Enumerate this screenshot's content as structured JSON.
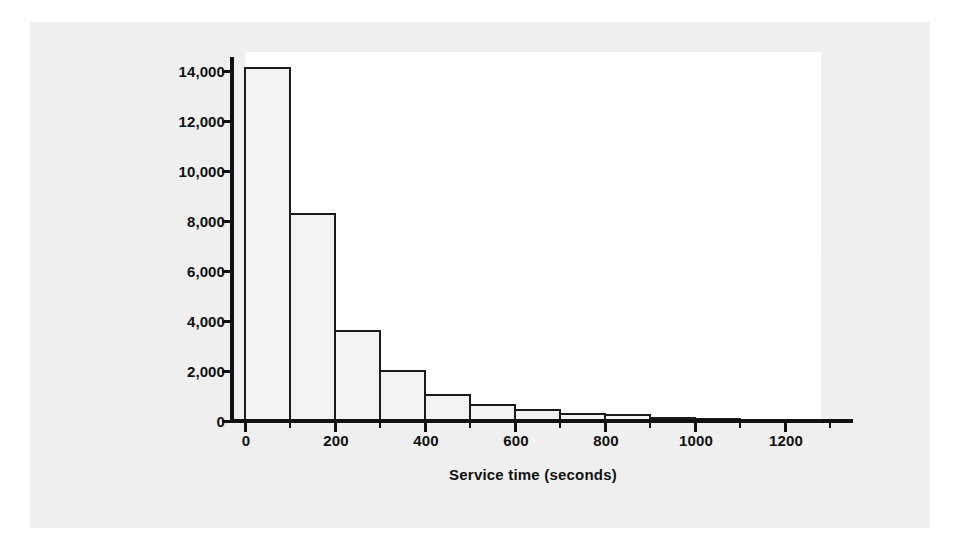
{
  "figure": {
    "background_color": "#ffffff",
    "panel_color": "#ececec",
    "plot_background_color": "#ffffff",
    "axis_color": "#111111",
    "bar_fill_color": "#f2f2f2",
    "bar_edge_color": "#1a1a1a"
  },
  "chart_data": {
    "type": "bar",
    "title": "",
    "subtitle": "",
    "xlabel": "Service time (seconds)",
    "ylabel": "Count of calls",
    "grid": false,
    "legend": false,
    "legend_position": "none",
    "bin_width": 100,
    "x": [
      0,
      100,
      200,
      300,
      400,
      500,
      600,
      700,
      800,
      900,
      1000,
      1100
    ],
    "categories": [
      "0-100",
      "100-200",
      "200-300",
      "300-400",
      "400-500",
      "500-600",
      "600-700",
      "700-800",
      "800-900",
      "900-1000",
      "1000-1100",
      "1100-1200"
    ],
    "values": [
      14150,
      8300,
      3600,
      2000,
      1050,
      650,
      450,
      280,
      230,
      130,
      90,
      40
    ],
    "xlim": [
      -75,
      1350
    ],
    "ylim": [
      0,
      14800
    ],
    "xticks": [
      0,
      200,
      400,
      600,
      800,
      1000,
      1200
    ],
    "xticklabels": [
      "0",
      "200",
      "400",
      "600",
      "800",
      "1000",
      "1200"
    ],
    "xminorticks": [
      100,
      300,
      500,
      700,
      900,
      1100,
      1300
    ],
    "yticks": [
      0,
      2000,
      4000,
      6000,
      8000,
      10000,
      12000,
      14000
    ],
    "yticklabels": [
      "0",
      "2,000",
      "4,000",
      "6,000",
      "8,000",
      "10,000",
      "12,000",
      "14,000"
    ]
  }
}
